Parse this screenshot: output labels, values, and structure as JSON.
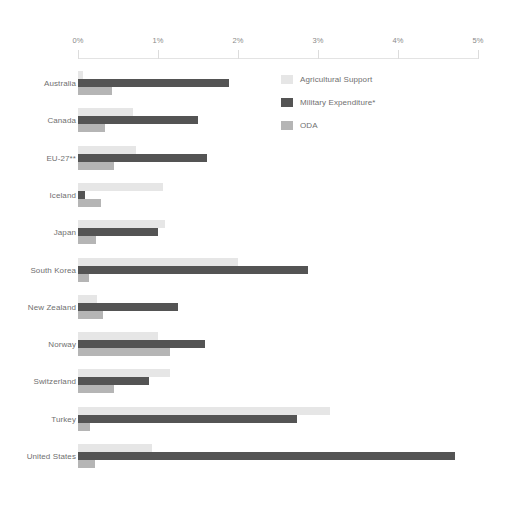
{
  "chart_data": {
    "type": "bar",
    "orientation": "horizontal",
    "grouped": true,
    "title": "",
    "subtitle": "",
    "xlabel": "",
    "ylabel": "",
    "xlim": [
      0,
      5
    ],
    "grid": false,
    "legend_position": "top-right",
    "axis_ticks": [
      "0%",
      "1%",
      "2%",
      "3%",
      "4%",
      "5%"
    ],
    "axis_tick_values": [
      0,
      1,
      2,
      3,
      4,
      5
    ],
    "categories": [
      "Australia",
      "Canada",
      "EU-27**",
      "Iceland",
      "Japan",
      "South Korea",
      "New Zealand",
      "Norway",
      "Switzerland",
      "Turkey",
      "United States"
    ],
    "series": [
      {
        "name": "Agricultural Support",
        "color": "#e6e6e6",
        "values": [
          0.06,
          0.69,
          0.72,
          1.06,
          1.09,
          2.0,
          0.24,
          1.0,
          1.15,
          3.15,
          0.93
        ]
      },
      {
        "name": "Military Expenditure*",
        "color": "#545454",
        "values": [
          1.89,
          1.5,
          1.61,
          0.09,
          1.0,
          2.88,
          1.25,
          1.59,
          0.89,
          2.74,
          4.71
        ]
      },
      {
        "name": "ODA",
        "color": "#b5b5b5",
        "values": [
          0.42,
          0.34,
          0.45,
          0.29,
          0.22,
          0.14,
          0.31,
          1.15,
          0.45,
          0.15,
          0.21
        ]
      }
    ]
  }
}
